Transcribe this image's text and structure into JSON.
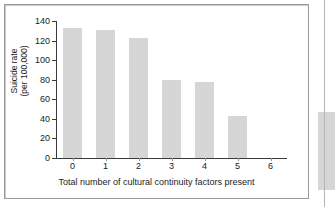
{
  "chart_data": {
    "type": "bar",
    "title": "",
    "xlabel": "Total number of cultural continuity factors present",
    "ylabel_line1": "Suicide rate",
    "ylabel_line2": "(per 100,000)",
    "categories": [
      "0",
      "1",
      "2",
      "3",
      "4",
      "5",
      "6"
    ],
    "values": [
      133,
      131,
      123,
      80,
      78,
      43,
      0
    ],
    "ylim": [
      0,
      140
    ],
    "yticks": [
      0,
      20,
      40,
      60,
      80,
      100,
      120,
      140
    ],
    "ytick_labels": [
      "0",
      "20",
      "40",
      "60",
      "80",
      "100",
      "120",
      "140"
    ],
    "grid": false,
    "legend": null,
    "bar_color": "#d6d6d6",
    "axis_color": "#3a3a3a"
  },
  "figure": {
    "frame_border_color": "#9a9a9a",
    "background": "#ffffff",
    "edge_artifact_color": "#d6d6d6"
  }
}
